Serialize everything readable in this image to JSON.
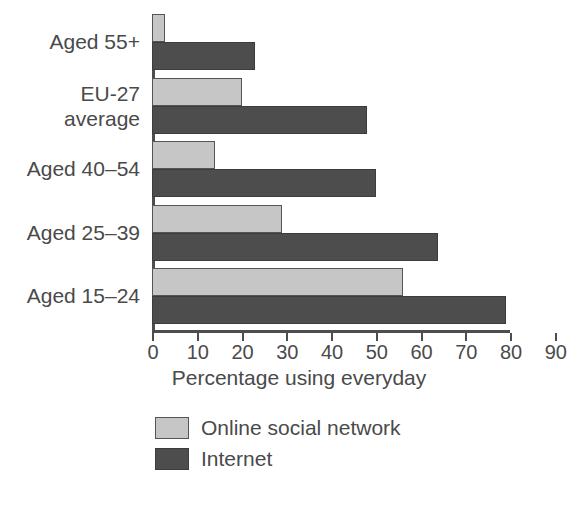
{
  "chart_data": {
    "type": "bar",
    "orientation": "horizontal",
    "title": "",
    "xlabel": "Percentage using everyday",
    "ylabel": "",
    "xlim": [
      0,
      90
    ],
    "xticks": [
      0,
      10,
      20,
      30,
      40,
      50,
      60,
      70,
      80,
      90
    ],
    "grid": false,
    "legend_position": "bottom-left",
    "categories": [
      "Aged 55+",
      "EU-27\naverage",
      "Aged 40–54",
      "Aged 25–39",
      "Aged 15–24"
    ],
    "series": [
      {
        "name": "Online social network",
        "color": "#c6c6c6",
        "values": [
          3,
          20,
          14,
          29,
          56
        ]
      },
      {
        "name": "Internet",
        "color": "#4d4d4d",
        "values": [
          23,
          48,
          50,
          64,
          79
        ]
      }
    ]
  },
  "axis": {
    "tick_labels": [
      "0",
      "10",
      "20",
      "30",
      "40",
      "50",
      "60",
      "70",
      "80",
      "90"
    ],
    "title": "Percentage using everyday"
  },
  "categories": {
    "c0": "Aged 55+",
    "c1": "EU-27\naverage",
    "c2": "Aged 40–54",
    "c3": "Aged 25–39",
    "c4": "Aged 15–24"
  },
  "legend": {
    "items": [
      {
        "label": "Online social network",
        "color": "#c6c6c6"
      },
      {
        "label": "Internet",
        "color": "#4d4d4d"
      }
    ],
    "item0_label": "Online social network",
    "item1_label": "Internet"
  }
}
